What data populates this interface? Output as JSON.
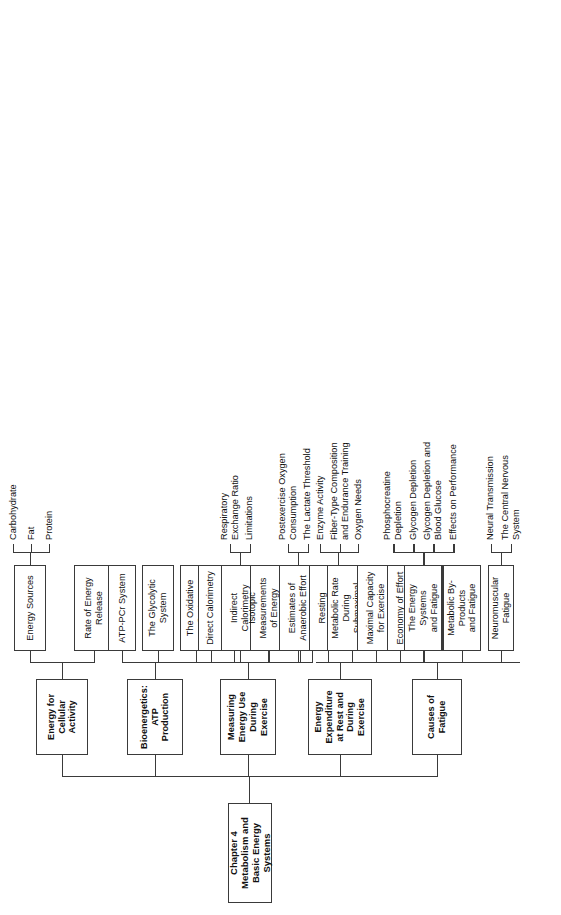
{
  "document": {
    "type": "chapter-outline-tree",
    "orientation": "landscape-rotated",
    "root": {
      "line1": "Chapter 4",
      "line2": "Metabolism and Basic Energy Systems"
    }
  },
  "branches": [
    {
      "id": "energy-cellular-activity",
      "title": "Energy for\nCellular Activity",
      "children": [
        {
          "label": "Energy Sources",
          "subitems": [
            "Carbohydrate",
            "Fat",
            "Protein"
          ]
        },
        {
          "label": "Rate of Energy\nRelease",
          "subitems": []
        }
      ]
    },
    {
      "id": "bioenergetics-atp-production",
      "title": "Bioenergetics:\nATP Production",
      "children": [
        {
          "label": "ATP-PCr System",
          "subitems": []
        },
        {
          "label": "The Glycolytic\nSystem",
          "subitems": []
        },
        {
          "label": "The Oxidative\nSystem",
          "subitems": []
        },
        {
          "label": "Oxidation of\nCarbohydrate",
          "subitems": []
        },
        {
          "label": "Oxidation of\nFat",
          "subitems": []
        },
        {
          "label": "Protein Metabolism",
          "subitems": []
        },
        {
          "label": "The Oxidative\nCapacity of Muscle",
          "subitems": [
            "Enzyme Activity",
            "Fiber-Type Composition\nand Endurance Training",
            "Oxygen Needs"
          ]
        }
      ]
    },
    {
      "id": "measuring-energy-use",
      "title": "Measuring Energy Use\nDuring Exercise",
      "children": [
        {
          "label": "Direct Calorimetry",
          "subitems": []
        },
        {
          "label": "Indirect\nCalorimetry",
          "subitems": [
            "Respiratory\nExchange Ratio",
            "Limitations"
          ]
        },
        {
          "label": "Isotopic Measurements\nof Energy Metabolism",
          "subitems": []
        },
        {
          "label": "Estimates of\nAnaerobic Effort",
          "subitems": [
            "Postexercise Oxygen\nConsumption",
            "The Lactate Threshold"
          ]
        }
      ]
    },
    {
      "id": "energy-expenditure",
      "title": "Energy Expenditure\nat Rest and During\nExercise",
      "children": [
        {
          "label": "Resting\nMetabolic Rate",
          "subitems": []
        },
        {
          "label": "Metabolic Rate\nDuring Submaximal\nExercise",
          "subitems": []
        },
        {
          "label": "Maximal Capacity\nfor Exercise",
          "subitems": []
        },
        {
          "label": "Economy of Effort",
          "subitems": []
        },
        {
          "label": "Energy Cost of\nVarious Activities",
          "subitems": []
        }
      ]
    },
    {
      "id": "causes-of-fatigue",
      "title": "Causes of Fatigue",
      "children": [
        {
          "label": "The Energy Systems\nand Fatigue",
          "subitems": [
            "Phosphocreatine\nDepletion",
            "Glycogen Depletion",
            "Glycogen Depletion and\nBlood Glucose",
            "Effects on Performance"
          ]
        },
        {
          "label": "Metabolic By-Products\nand Fatigue",
          "subitems": []
        },
        {
          "label": "Neuromuscular Fatigue",
          "subitems": [
            "Neural Transmission",
            "The Central Nervous\nSystem"
          ]
        }
      ]
    }
  ],
  "colors": {
    "stroke": "#3a3a3a",
    "background": "#ffffff",
    "text": "#111111"
  }
}
